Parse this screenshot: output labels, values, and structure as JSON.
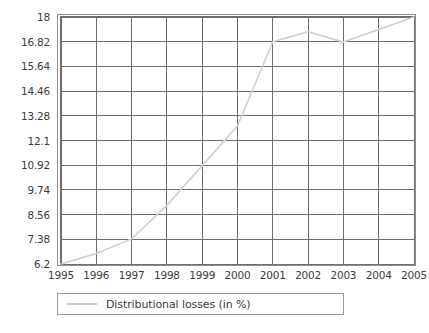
{
  "chart_data": {
    "type": "line",
    "title": "",
    "xlabel": "",
    "ylabel": "",
    "categories": [
      "1995",
      "1996",
      "1997",
      "1998",
      "1999",
      "2000",
      "2001",
      "2002",
      "2003",
      "2004",
      "2005"
    ],
    "series": [
      {
        "name": "Distributional losses (in %)",
        "values": [
          6.2,
          6.7,
          7.4,
          9.0,
          10.9,
          12.8,
          16.82,
          17.3,
          16.8,
          17.4,
          18.0
        ],
        "color": "#d0d0d0"
      }
    ],
    "ylim": [
      6.2,
      18
    ],
    "yticks": [
      6.2,
      7.38,
      8.56,
      9.74,
      10.92,
      12.1,
      13.28,
      14.46,
      15.64,
      16.82,
      18
    ],
    "ytick_labels": [
      "6.2",
      "7.38",
      "8.56",
      "9.74",
      "10.92",
      "12.1",
      "13.28",
      "14.46",
      "15.64",
      "16.82",
      "18"
    ],
    "xtick_labels": [
      "1995",
      "1996",
      "1997",
      "1998",
      "1999",
      "2000",
      "2001",
      "2002",
      "2003",
      "2004",
      "2005"
    ],
    "grid": true,
    "grid_color": "#6e6e6e",
    "legend_position": "bottom-left"
  },
  "legend": {
    "entries": [
      {
        "label": "Distributional losses (in %)",
        "swatch": "line-swatch"
      }
    ]
  }
}
